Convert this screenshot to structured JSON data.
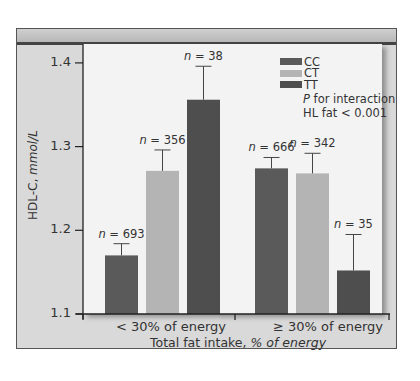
{
  "chart_data": {
    "type": "bar",
    "title": "",
    "xlabel": "Total fat intake, % of energy",
    "xlabel_prefix": "Total fat intake, ",
    "xlabel_italic": "% of energy",
    "ylabel": "HDL-C, mmol/L",
    "ylabel_prefix": "HDL-C, ",
    "ylabel_italic": "mmol/L",
    "ylim": [
      1.1,
      1.4
    ],
    "yticks": [
      "1.4",
      "1.3",
      "1.2",
      "1.1"
    ],
    "categories": [
      "< 30% of energy",
      "≥ 30% of energy"
    ],
    "series": [
      {
        "name": "CC",
        "color": "#5a5a5a",
        "values": [
          1.17,
          1.274
        ],
        "error_upper": [
          1.184,
          1.287
        ],
        "n": [
          "693",
          "666"
        ]
      },
      {
        "name": "CT",
        "color": "#b4b4b4",
        "values": [
          1.271,
          1.268
        ],
        "error_upper": [
          1.296,
          1.292
        ],
        "n": [
          "356",
          "342"
        ]
      },
      {
        "name": "TT",
        "color": "#4e4e4e",
        "values": [
          1.356,
          1.152
        ],
        "error_upper": [
          1.396,
          1.195
        ],
        "n": [
          "38",
          "35"
        ]
      }
    ],
    "legend_position": "top-right",
    "annotation": [
      "P for interaction",
      "HL fat < 0.001"
    ],
    "annotation_italic_prefix": "P",
    "annotation_line1_rest": " for interaction",
    "grid": false
  },
  "n_prefix": "n",
  "n_eq": " = "
}
